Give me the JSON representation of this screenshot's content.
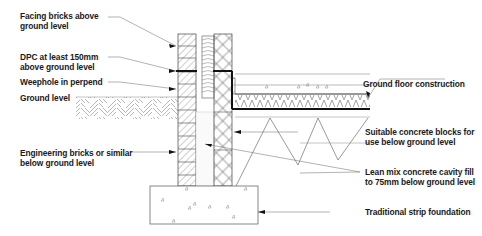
{
  "diagram": {
    "labels_left": [
      {
        "id": "facing-bricks",
        "line1": "Facing bricks above",
        "line2": "ground level"
      },
      {
        "id": "dpc",
        "line1": "DPC at least 150mm",
        "line2": "above ground level"
      },
      {
        "id": "weephole",
        "line1": "Weephole in perpend",
        "line2": ""
      },
      {
        "id": "ground-level",
        "line1": "Ground level",
        "line2": ""
      },
      {
        "id": "engineering-bricks",
        "line1": "Engineering bricks or similar",
        "line2": "below ground level"
      }
    ],
    "labels_right": [
      {
        "id": "ground-floor",
        "line1": "Ground floor construction",
        "line2": ""
      },
      {
        "id": "concrete-blocks",
        "line1": "Suitable concrete blocks for",
        "line2": "use below ground level"
      },
      {
        "id": "cavity-fill",
        "line1": "Lean mix concrete cavity fill",
        "line2": "to 75mm below ground level"
      },
      {
        "id": "strip-foundation",
        "line1": "Traditional strip foundation",
        "line2": ""
      }
    ],
    "colors": {
      "line": "#333333",
      "hatch": "#777777",
      "dpc": "#111111",
      "background": "#ffffff"
    }
  }
}
